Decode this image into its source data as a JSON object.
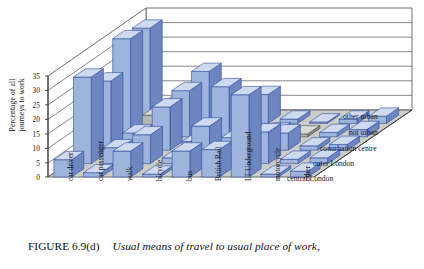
{
  "figure": {
    "number": "FIGURE 6.9(d)",
    "caption": "Usual means of travel to usual place of work,"
  },
  "chart_data": {
    "type": "bar",
    "subtype": "3d-grouped-bar",
    "title": "Usual means of travel to usual place of work,",
    "xlabel": "",
    "ylabel": "Percentage of all journeys to work",
    "zlabel": "",
    "ylim": [
      0,
      35
    ],
    "yticks": [
      0,
      5,
      10,
      15,
      20,
      25,
      30,
      35
    ],
    "grid": true,
    "legend_position": "right-depth-axis",
    "categories": [
      "car driver",
      "car passenger",
      "walk",
      "bicycle",
      "bus",
      "British Rail",
      "LT Underground",
      "motorcycle",
      "other"
    ],
    "depth_categories": [
      "central London",
      "outer London",
      "conurbation centre",
      "not urban",
      "other urban"
    ],
    "series": [
      {
        "name": "central London",
        "values": [
          6.0,
          1.5,
          9.0,
          1.0,
          9.0,
          9.5,
          28.5,
          1.0,
          2.0
        ]
      },
      {
        "name": "outer London",
        "values": [
          30.0,
          5.5,
          10.0,
          2.0,
          13.0,
          9.0,
          11.0,
          1.5,
          2.0
        ]
      },
      {
        "name": "conurbation centre",
        "values": [
          24.0,
          6.0,
          15.0,
          3.0,
          22.0,
          4.0,
          6.0,
          1.5,
          2.0
        ]
      },
      {
        "name": "not urban",
        "values": [
          34.0,
          7.5,
          16.0,
          3.5,
          12.0,
          2.0,
          1.0,
          1.5,
          2.5
        ]
      },
      {
        "name": "other urban",
        "values": [
          33.0,
          7.0,
          18.0,
          4.0,
          10.0,
          1.5,
          0.5,
          1.5,
          2.5
        ]
      }
    ],
    "colors": {
      "bar_front": "#9fb4dd",
      "bar_side": "#6d86c0",
      "bar_top": "#cfdaf0",
      "bar_edge": "#2a49a0",
      "bar_alt_front": "#b6b6b2",
      "bar_alt_side": "#8a8a86",
      "bar_alt_top": "#d8d8d4",
      "floor": "#cdcdc8",
      "wall": "#ffffff",
      "gridline": "#6a6a6a"
    }
  },
  "axis": {
    "y_title_line1": "Percentage of all",
    "y_title_line2": "journeys to work",
    "yticks": [
      "35",
      "30",
      "25",
      "20",
      "15",
      "10",
      "5",
      "0"
    ]
  }
}
